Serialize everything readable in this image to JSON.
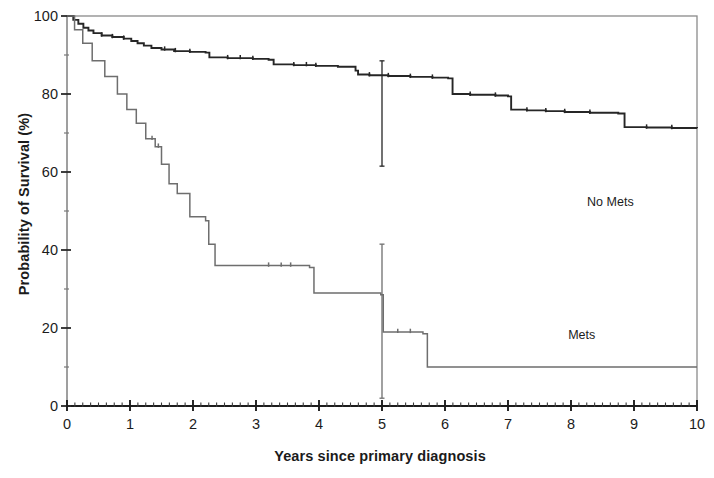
{
  "chart_data": {
    "type": "line",
    "subtype": "kaplan-meier-survival",
    "title": "",
    "xlabel": "Years since primary diagnosis",
    "ylabel": "Probability of Survival (%)",
    "xlim": [
      0,
      10
    ],
    "ylim": [
      0,
      100
    ],
    "xticks": [
      0,
      1,
      2,
      3,
      4,
      5,
      6,
      7,
      8,
      9,
      10
    ],
    "xtick_labels": [
      "0",
      "1",
      "2",
      "3",
      "4",
      "5",
      "6",
      "7",
      "8",
      "9",
      "10"
    ],
    "yticks": [
      0,
      20,
      40,
      60,
      80,
      100
    ],
    "ytick_labels": [
      "0",
      "20",
      "40",
      "60",
      "80",
      "100"
    ],
    "yminor_ticks": [
      10,
      30,
      50,
      70,
      90
    ],
    "grid": false,
    "legend_position": "inline-annotations",
    "frame": true,
    "annotations": [
      {
        "text": "No Mets",
        "x": 8.7,
        "y": 52
      },
      {
        "text": "Mets",
        "x": 8.4,
        "y": 18
      }
    ],
    "series": [
      {
        "name": "No Mets",
        "color": "#262626",
        "step_points": [
          [
            0.0,
            100.0
          ],
          [
            0.1,
            99.0
          ],
          [
            0.18,
            98.0
          ],
          [
            0.26,
            97.0
          ],
          [
            0.34,
            96.3
          ],
          [
            0.42,
            95.6
          ],
          [
            0.55,
            95.0
          ],
          [
            0.72,
            94.6
          ],
          [
            0.9,
            94.2
          ],
          [
            1.02,
            93.6
          ],
          [
            1.12,
            93.0
          ],
          [
            1.22,
            92.4
          ],
          [
            1.34,
            91.8
          ],
          [
            1.5,
            91.4
          ],
          [
            1.7,
            91.0
          ],
          [
            1.95,
            90.8
          ],
          [
            2.2,
            90.6
          ],
          [
            2.26,
            89.4
          ],
          [
            2.55,
            89.2
          ],
          [
            2.95,
            89.0
          ],
          [
            3.2,
            88.8
          ],
          [
            3.28,
            87.6
          ],
          [
            3.6,
            87.4
          ],
          [
            3.95,
            87.2
          ],
          [
            4.3,
            87.0
          ],
          [
            4.58,
            86.0
          ],
          [
            4.62,
            85.0
          ],
          [
            4.8,
            84.8
          ],
          [
            5.1,
            84.6
          ],
          [
            5.45,
            84.4
          ],
          [
            5.8,
            84.2
          ],
          [
            6.05,
            84.0
          ],
          [
            6.12,
            80.0
          ],
          [
            6.4,
            79.8
          ],
          [
            6.8,
            79.6
          ],
          [
            7.0,
            79.4
          ],
          [
            7.05,
            76.0
          ],
          [
            7.3,
            75.8
          ],
          [
            7.6,
            75.6
          ],
          [
            7.9,
            75.4
          ],
          [
            8.3,
            75.2
          ],
          [
            8.75,
            75.0
          ],
          [
            8.85,
            71.5
          ],
          [
            9.2,
            71.4
          ],
          [
            9.6,
            71.3
          ],
          [
            10.0,
            71.2
          ]
        ],
        "censor_marks": [
          0.55,
          0.72,
          0.9,
          1.55,
          1.72,
          1.95,
          2.55,
          2.75,
          2.95,
          3.6,
          3.8,
          3.95,
          4.8,
          5.1,
          5.45,
          5.8,
          6.4,
          6.8,
          7.3,
          7.6,
          7.9,
          8.3,
          9.2,
          9.6
        ],
        "start_value": 100,
        "end_value": 57.5,
        "milestones": {
          "1_year": 93,
          "2_year": 90.5,
          "5_year": 75,
          "10_year": 57.5
        }
      },
      {
        "name": "Mets",
        "color": "#6e6e6e",
        "step_points": [
          [
            0.0,
            100.0
          ],
          [
            0.12,
            96.5
          ],
          [
            0.25,
            93.0
          ],
          [
            0.4,
            88.5
          ],
          [
            0.6,
            84.5
          ],
          [
            0.8,
            80.0
          ],
          [
            0.95,
            76.0
          ],
          [
            1.1,
            72.5
          ],
          [
            1.25,
            68.5
          ],
          [
            1.4,
            66.5
          ],
          [
            1.5,
            62.0
          ],
          [
            1.62,
            57.0
          ],
          [
            1.75,
            54.5
          ],
          [
            1.95,
            48.5
          ],
          [
            2.2,
            47.5
          ],
          [
            2.25,
            41.5
          ],
          [
            2.35,
            36.0
          ],
          [
            3.85,
            35.5
          ],
          [
            3.92,
            29.0
          ],
          [
            4.98,
            28.5
          ],
          [
            5.02,
            19.0
          ],
          [
            5.65,
            18.5
          ],
          [
            5.72,
            10.0
          ],
          [
            10.0,
            10.0
          ]
        ],
        "censor_marks": [
          1.35,
          1.45,
          3.2,
          3.4,
          3.55,
          5.25,
          5.45
        ],
        "start_value": 100,
        "end_value": 10,
        "milestones": {
          "1_year": 74,
          "2_year": 47,
          "5_year": 19,
          "10_year": 10
        }
      }
    ],
    "error_bars": [
      {
        "series": "No Mets",
        "x": 5.0,
        "value": 75.0,
        "lower": 61.5,
        "upper": 88.5
      },
      {
        "series": "Mets",
        "x": 5.0,
        "value": 19.0,
        "lower": 2.0,
        "upper": 41.5
      }
    ]
  }
}
